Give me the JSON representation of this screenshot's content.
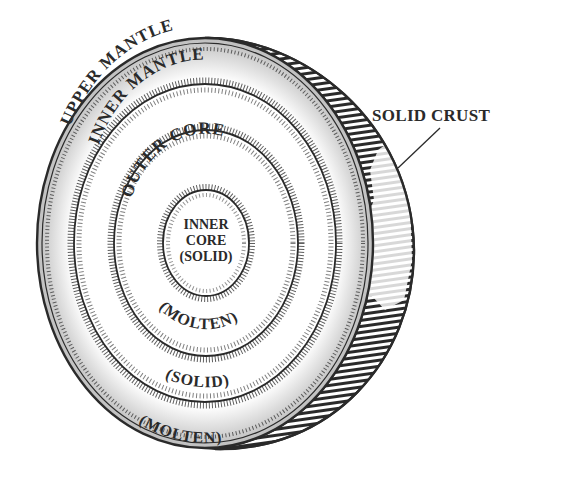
{
  "diagram": {
    "callout": {
      "label": "SOLID CRUST"
    },
    "layers": [
      {
        "name": "UPPER MANTLE",
        "state": "(MOLTEN)"
      },
      {
        "name": "INNER MANTLE",
        "state": "(SOLID)"
      },
      {
        "name": "OUTER CORE",
        "state": "(MOLTEN)"
      },
      {
        "name_line1": "INNER",
        "name_line2": "CORE",
        "state": "(SOLID)"
      }
    ],
    "colors": {
      "ink": "#2a2a2a",
      "background": "#ffffff"
    }
  }
}
